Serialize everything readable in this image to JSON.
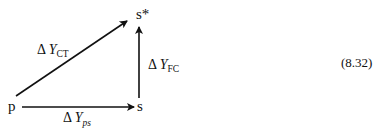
{
  "diagram": {
    "nodes": {
      "p": "p",
      "s": "s",
      "s_star": "s*"
    },
    "edges": [
      {
        "from": "p",
        "to": "s",
        "label_main": "Y",
        "label_sub": "ps"
      },
      {
        "from": "p",
        "to": "s*",
        "label_main": "Y",
        "label_sub": "CT"
      },
      {
        "from": "s",
        "to": "s*",
        "label_main": "Y",
        "label_sub": "FC"
      }
    ],
    "delta": "Δ",
    "equation_number": "(8.32)"
  }
}
